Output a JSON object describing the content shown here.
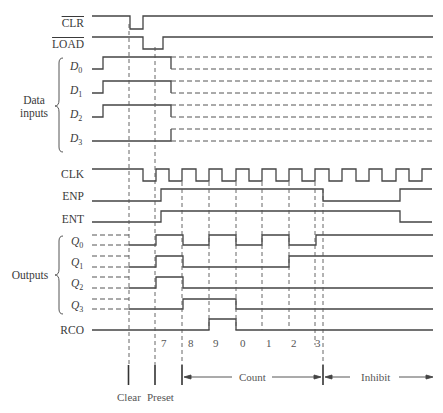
{
  "figure": {
    "type": "timing-diagram",
    "signals": {
      "clr": "CLR",
      "load": "LOAD",
      "d0": {
        "base": "D",
        "sub": "0"
      },
      "d1": {
        "base": "D",
        "sub": "1"
      },
      "d2": {
        "base": "D",
        "sub": "2"
      },
      "d3": {
        "base": "D",
        "sub": "3"
      },
      "clk": "CLK",
      "enp": "ENP",
      "ent": "ENT",
      "q0": {
        "base": "Q",
        "sub": "0"
      },
      "q1": {
        "base": "Q",
        "sub": "1"
      },
      "q2": {
        "base": "Q",
        "sub": "2"
      },
      "q3": {
        "base": "Q",
        "sub": "3"
      },
      "rco": "RCO"
    },
    "groups": {
      "data_inputs_line1": "Data",
      "data_inputs_line2": "inputs",
      "outputs": "Outputs"
    },
    "count_values": [
      "7",
      "8",
      "9",
      "0",
      "1",
      "2",
      "3"
    ],
    "phases": {
      "clear": "Clear",
      "preset": "Preset",
      "count": "Count",
      "inhibit": "Inhibit"
    },
    "colors": {
      "signal": "#444444",
      "dashed": "#555555",
      "text": "#3a3a3a"
    }
  }
}
